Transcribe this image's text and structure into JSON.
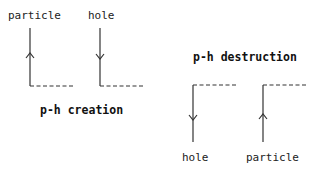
{
  "diagrams": [
    {
      "title": "p-h creation",
      "legs": [
        {
          "label": "particle",
          "arrow": "up"
        },
        {
          "label": "hole",
          "arrow": "down"
        }
      ]
    },
    {
      "title": "p-h destruction",
      "legs": [
        {
          "label": "hole",
          "arrow": "down"
        },
        {
          "label": "particle",
          "arrow": "up"
        }
      ]
    }
  ],
  "colors": {
    "line": "#333333",
    "text": "#222222"
  }
}
